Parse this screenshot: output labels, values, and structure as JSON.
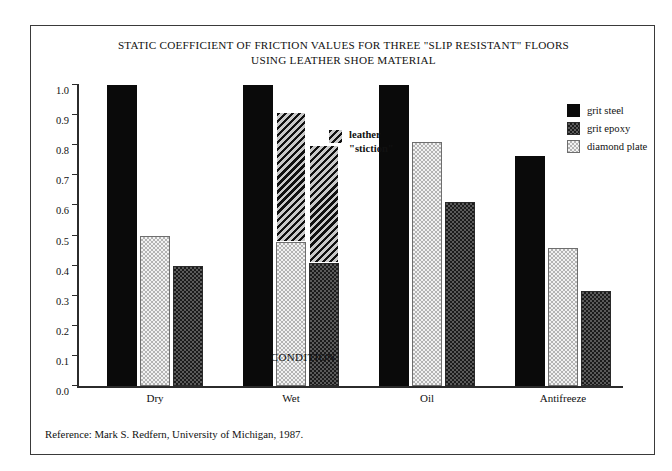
{
  "chart_data": {
    "type": "bar",
    "title": "STATIC COEFFICIENT OF FRICTION VALUES FOR THREE \"SLIP RESISTANT\" FLOORS USING LEATHER SHOE MATERIAL",
    "title_line1": "STATIC COEFFICIENT OF FRICTION VALUES FOR THREE \"SLIP RESISTANT\" FLOORS",
    "title_line2": "USING LEATHER SHOE MATERIAL",
    "xlabel": "CONDITION",
    "ylabel": "COF Values (measured using big foot)",
    "ylim": [
      0.0,
      1.0
    ],
    "ytick_values": [
      0.0,
      0.1,
      0.2,
      0.3,
      0.4,
      0.5,
      0.6,
      0.7,
      0.8,
      0.9,
      1.0
    ],
    "ytick_labels": [
      "0.0",
      "0.1",
      "0.2",
      "0.3",
      "0.4",
      "0.5",
      "0.6",
      "0.7",
      "0.8",
      "0.9",
      "1.0"
    ],
    "grid": false,
    "legend_position": "top-right",
    "categories": [
      "Dry",
      "Wet",
      "Oil",
      "Antifreeze"
    ],
    "series": [
      {
        "name": "grit steel",
        "key": "grit-steel",
        "fill": "solid",
        "values": [
          1.0,
          1.0,
          1.0,
          0.765
        ]
      },
      {
        "name": "diamond plate",
        "key": "diamond-plate",
        "fill": "light",
        "values": [
          0.5,
          0.48,
          0.81,
          0.46
        ]
      },
      {
        "name": "grit epoxy",
        "key": "grit-epoxy",
        "fill": "dark",
        "values": [
          0.4,
          0.41,
          0.61,
          0.315
        ]
      }
    ],
    "stiction_overlay": {
      "label_line1": "leather",
      "label_line2": "\"stiction\"",
      "fill": "hatch",
      "note": "Wet condition only: hatched segment stacked above base value",
      "segments": [
        {
          "category": "Wet",
          "series": "diamond plate",
          "base": 0.48,
          "top": 0.91
        },
        {
          "category": "Wet",
          "series": "grit epoxy",
          "base": 0.41,
          "top": 0.8
        }
      ]
    },
    "bar_order_in_group": [
      "grit steel",
      "diamond plate",
      "grit epoxy"
    ]
  },
  "legend": {
    "items": [
      {
        "label": "grit steel",
        "fill": "solid"
      },
      {
        "label": "grit epoxy",
        "fill": "dark"
      },
      {
        "label": "diamond plate",
        "fill": "light"
      }
    ]
  },
  "reference": {
    "text": "Reference: Mark S. Redfern, University of Michigan, 1987."
  },
  "colors": {
    "solid": "#0a0a0a",
    "dark": "#3b3b3b",
    "light": "#dcdcdc",
    "hatch": "#3d3d3d",
    "axis": "#2b2b2b",
    "frame": "#3a3a3a",
    "background": "#ffffff"
  }
}
